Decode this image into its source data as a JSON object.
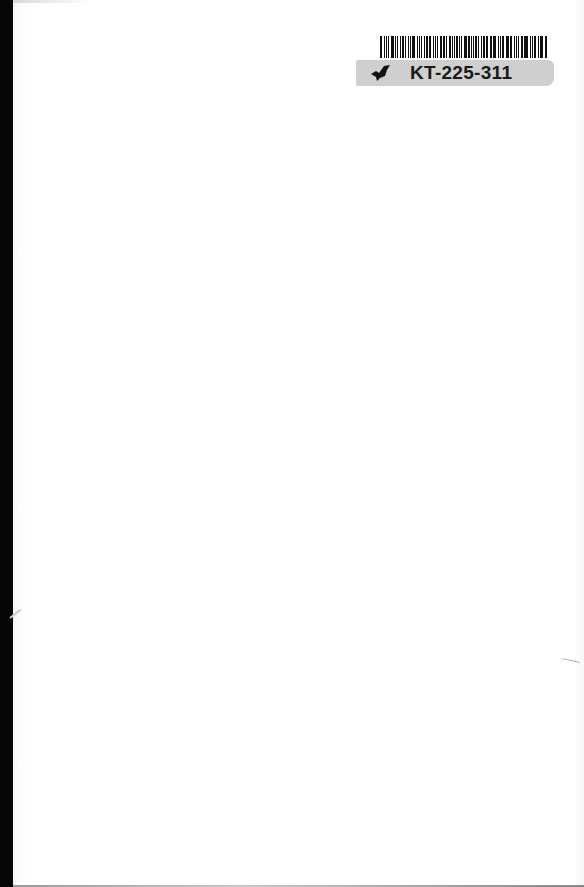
{
  "page": {
    "type": "scanned blank book page",
    "background_color": "#ffffff",
    "spine_color": "#060606"
  },
  "library_label": {
    "barcode_icon": "barcode-icon",
    "logo_icon": "bird-logo-icon",
    "code": "KT-225-311",
    "strip_color": "#cfcfcf"
  }
}
